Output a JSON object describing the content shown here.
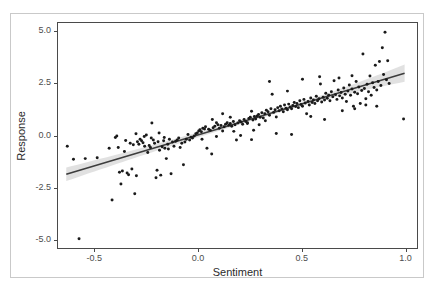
{
  "chart_data": {
    "type": "scatter",
    "title": "",
    "xlabel": "Sentiment",
    "ylabel": "Response",
    "xlim": [
      -0.68,
      1.06
    ],
    "ylim": [
      -5.45,
      5.45
    ],
    "xticks": [
      -0.5,
      0.0,
      0.5,
      1.0
    ],
    "xtick_labels": [
      "-0.5",
      "0.0",
      "0.5",
      "1.0"
    ],
    "yticks": [
      5.0,
      2.5,
      0.0,
      -2.5,
      -5.0
    ],
    "ytick_labels": [
      "5.0",
      "2.5",
      "0.0",
      "-2.5",
      "-5.0"
    ],
    "grid": false,
    "legend": "none",
    "point_color": "#1a1a1a",
    "point_size": 3.0,
    "line_color": "#3d3d3d",
    "band_color": "#c8c8c8",
    "panel_border_color": "#4a4a4a",
    "regression": {
      "type": "linear-fit-with-confidence-band",
      "x_start": -0.64,
      "x_end": 1.0,
      "y_start": -1.88,
      "y_end": 3.02,
      "slope": 2.99,
      "intercept": 0.03,
      "band_halfwidth_start": 0.33,
      "band_halfwidth_mid": 0.09,
      "band_halfwidth_end": 0.42
    },
    "points": [
      [
        -0.635,
        -0.52
      ],
      [
        -0.605,
        -1.15
      ],
      [
        -0.578,
        -5.0
      ],
      [
        -0.548,
        -1.12
      ],
      [
        -0.49,
        -1.08
      ],
      [
        -0.432,
        -0.62
      ],
      [
        -0.418,
        -3.12
      ],
      [
        -0.402,
        -0.1
      ],
      [
        -0.395,
        -0.02
      ],
      [
        -0.388,
        -0.58
      ],
      [
        -0.382,
        -1.78
      ],
      [
        -0.375,
        -2.35
      ],
      [
        -0.368,
        -1.72
      ],
      [
        -0.358,
        -0.78
      ],
      [
        -0.352,
        -0.24
      ],
      [
        -0.345,
        -1.82
      ],
      [
        -0.338,
        -1.9
      ],
      [
        -0.33,
        -0.38
      ],
      [
        -0.322,
        -1.62
      ],
      [
        -0.315,
        -0.45
      ],
      [
        -0.308,
        -2.82
      ],
      [
        -0.3,
        -1.95
      ],
      [
        -0.295,
        -0.3
      ],
      [
        -0.288,
        -0.42
      ],
      [
        -0.282,
        -0.18
      ],
      [
        -0.275,
        -0.25
      ],
      [
        -0.268,
        -0.35
      ],
      [
        -0.26,
        -0.52
      ],
      [
        -0.252,
        0.02
      ],
      [
        -0.245,
        -0.82
      ],
      [
        -0.238,
        -0.48
      ],
      [
        -0.232,
        -0.58
      ],
      [
        -0.225,
        0.6
      ],
      [
        -0.218,
        -0.22
      ],
      [
        -0.212,
        -0.38
      ],
      [
        -0.205,
        -2.05
      ],
      [
        -0.2,
        -1.68
      ],
      [
        -0.195,
        -0.3
      ],
      [
        -0.188,
        -0.72
      ],
      [
        -0.182,
        -1.92
      ],
      [
        -0.175,
        -0.55
      ],
      [
        -0.168,
        -0.25
      ],
      [
        -0.162,
        -0.62
      ],
      [
        -0.155,
        -1.12
      ],
      [
        -0.148,
        -0.42
      ],
      [
        -0.14,
        -0.18
      ],
      [
        -0.132,
        -1.85
      ],
      [
        -0.125,
        -0.32
      ],
      [
        -0.118,
        -0.52
      ],
      [
        -0.11,
        -0.28
      ],
      [
        -0.102,
        -0.22
      ],
      [
        -0.095,
        -0.12
      ],
      [
        -0.088,
        -0.58
      ],
      [
        -0.08,
        -0.38
      ],
      [
        -0.072,
        -1.42
      ],
      [
        -0.065,
        -0.32
      ],
      [
        -0.058,
        -0.18
      ],
      [
        -0.05,
        0.05
      ],
      [
        -0.042,
        -0.22
      ],
      [
        -0.035,
        -0.08
      ],
      [
        -0.028,
        -0.12
      ],
      [
        -0.02,
        -0.02
      ],
      [
        -0.012,
        0.08
      ],
      [
        -0.005,
        0.12
      ],
      [
        0.002,
        0.22
      ],
      [
        0.008,
        0.28
      ],
      [
        0.015,
        0.18
      ],
      [
        0.022,
        0.35
      ],
      [
        0.03,
        0.32
      ],
      [
        0.035,
        0.42
      ],
      [
        0.042,
        -0.62
      ],
      [
        0.05,
        0.3
      ],
      [
        0.058,
        0.25
      ],
      [
        0.065,
        -0.9
      ],
      [
        0.072,
        0.38
      ],
      [
        0.08,
        0.45
      ],
      [
        0.088,
        -0.05
      ],
      [
        0.095,
        0.52
      ],
      [
        0.102,
        0.35
      ],
      [
        0.11,
        0.48
      ],
      [
        0.118,
        0.22
      ],
      [
        0.125,
        0.42
      ],
      [
        0.132,
        0.55
      ],
      [
        0.14,
        0.62
      ],
      [
        0.148,
        0.5
      ],
      [
        0.155,
        0.58
      ],
      [
        0.162,
        0.45
      ],
      [
        0.17,
        0.68
      ],
      [
        0.178,
        0.52
      ],
      [
        0.185,
        -0.22
      ],
      [
        0.192,
        0.6
      ],
      [
        0.2,
        0.72
      ],
      [
        0.208,
        0.65
      ],
      [
        0.215,
        0.55
      ],
      [
        0.222,
        0.78
      ],
      [
        0.23,
        0.68
      ],
      [
        0.238,
        0.58
      ],
      [
        0.245,
        0.82
      ],
      [
        0.252,
        0.88
      ],
      [
        0.258,
        -0.2
      ],
      [
        0.265,
        0.75
      ],
      [
        0.272,
        0.92
      ],
      [
        0.278,
        0.8
      ],
      [
        0.285,
        0.95
      ],
      [
        0.292,
        1.02
      ],
      [
        0.3,
        0.88
      ],
      [
        0.308,
        1.1
      ],
      [
        0.315,
        0.85
      ],
      [
        0.322,
        1.05
      ],
      [
        0.33,
        1.22
      ],
      [
        0.338,
        1.15
      ],
      [
        0.345,
        0.98
      ],
      [
        0.352,
        1.3
      ],
      [
        0.358,
        2.0
      ],
      [
        0.365,
        1.12
      ],
      [
        0.372,
        1.25
      ],
      [
        0.378,
        0.1
      ],
      [
        0.385,
        1.35
      ],
      [
        0.392,
        1.2
      ],
      [
        0.398,
        1.42
      ],
      [
        0.405,
        1.28
      ],
      [
        0.412,
        1.15
      ],
      [
        0.418,
        1.48
      ],
      [
        0.425,
        1.32
      ],
      [
        0.432,
        1.25
      ],
      [
        0.438,
        1.52
      ],
      [
        0.445,
        1.38
      ],
      [
        0.452,
        1.3
      ],
      [
        0.458,
        1.45
      ],
      [
        0.465,
        1.6
      ],
      [
        0.472,
        1.4
      ],
      [
        0.478,
        1.55
      ],
      [
        0.485,
        1.35
      ],
      [
        0.492,
        1.68
      ],
      [
        0.498,
        1.5
      ],
      [
        0.505,
        1.42
      ],
      [
        0.512,
        1.75
      ],
      [
        0.518,
        1.58
      ],
      [
        0.525,
        1.05
      ],
      [
        0.532,
        1.65
      ],
      [
        0.538,
        1.48
      ],
      [
        0.545,
        1.82
      ],
      [
        0.552,
        1.6
      ],
      [
        0.558,
        1.72
      ],
      [
        0.565,
        1.55
      ],
      [
        0.572,
        1.9
      ],
      [
        0.578,
        1.68
      ],
      [
        0.585,
        1.78
      ],
      [
        0.592,
        2.5
      ],
      [
        0.598,
        1.62
      ],
      [
        0.605,
        1.85
      ],
      [
        0.612,
        1.72
      ],
      [
        0.618,
        2.05
      ],
      [
        0.625,
        1.8
      ],
      [
        0.632,
        1.95
      ],
      [
        0.638,
        1.68
      ],
      [
        0.645,
        2.12
      ],
      [
        0.652,
        1.88
      ],
      [
        0.658,
        2.65
      ],
      [
        0.665,
        1.98
      ],
      [
        0.672,
        1.75
      ],
      [
        0.678,
        2.2
      ],
      [
        0.685,
        1.92
      ],
      [
        0.692,
        2.08
      ],
      [
        0.698,
        1.82
      ],
      [
        0.705,
        2.3
      ],
      [
        0.712,
        2.0
      ],
      [
        0.718,
        1.65
      ],
      [
        0.725,
        2.15
      ],
      [
        0.732,
        2.45
      ],
      [
        0.738,
        1.95
      ],
      [
        0.745,
        2.25
      ],
      [
        0.752,
        1.42
      ],
      [
        0.758,
        2.1
      ],
      [
        0.765,
        2.62
      ],
      [
        0.772,
        2.02
      ],
      [
        0.778,
        2.35
      ],
      [
        0.785,
        1.55
      ],
      [
        0.792,
        2.18
      ],
      [
        0.798,
        3.95
      ],
      [
        0.805,
        2.28
      ],
      [
        0.812,
        1.78
      ],
      [
        0.818,
        2.48
      ],
      [
        0.825,
        2.12
      ],
      [
        0.832,
        2.88
      ],
      [
        0.838,
        1.95
      ],
      [
        0.845,
        2.55
      ],
      [
        0.852,
        2.32
      ],
      [
        0.858,
        3.4
      ],
      [
        0.865,
        2.2
      ],
      [
        0.872,
        2.62
      ],
      [
        0.878,
        3.58
      ],
      [
        0.885,
        2.42
      ],
      [
        0.892,
        4.25
      ],
      [
        0.898,
        2.95
      ],
      [
        0.905,
        5.0
      ],
      [
        0.912,
        2.7
      ],
      [
        0.918,
        3.62
      ],
      [
        0.925,
        2.52
      ],
      [
        0.995,
        0.8
      ],
      [
        0.345,
        2.62
      ],
      [
        0.545,
        0.92
      ],
      [
        0.612,
        0.78
      ],
      [
        0.452,
        0.05
      ],
      [
        0.268,
        0.25
      ],
      [
        0.205,
        0.0
      ],
      [
        0.118,
        1.05
      ],
      [
        0.068,
        0.78
      ],
      [
        0.155,
        0.88
      ],
      [
        0.238,
        0.62
      ],
      [
        0.295,
        0.52
      ],
      [
        0.378,
        0.9
      ],
      [
        0.432,
        2.15
      ],
      [
        0.505,
        2.72
      ],
      [
        0.698,
        1.2
      ],
      [
        0.758,
        1.3
      ],
      [
        0.812,
        1.48
      ],
      [
        0.865,
        1.42
      ],
      [
        0.745,
        2.9
      ],
      [
        0.682,
        2.78
      ],
      [
        0.588,
        2.85
      ],
      [
        -0.228,
        -0.12
      ],
      [
        -0.262,
        -0.05
      ],
      [
        -0.19,
        0.12
      ],
      [
        -0.302,
        0.08
      ],
      [
        -0.165,
        -0.1
      ],
      [
        -0.145,
        -0.65
      ],
      [
        0.018,
        -0.18
      ],
      [
        0.088,
        0.62
      ],
      [
        0.172,
        0.2
      ],
      [
        0.258,
        1.18
      ],
      [
        0.325,
        0.72
      ]
    ]
  }
}
